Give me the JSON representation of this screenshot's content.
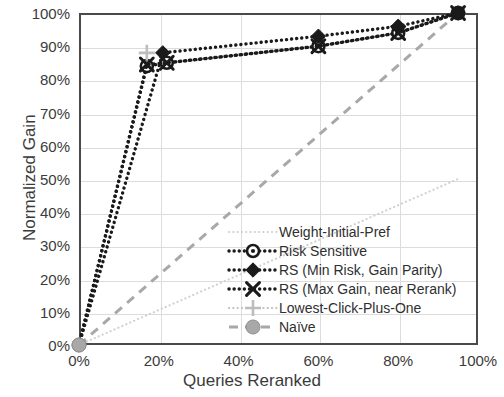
{
  "chart_data": {
    "type": "line",
    "title": "",
    "xlabel": "Queries Reranked",
    "ylabel": "Normalized Gain",
    "xlim": [
      0,
      100
    ],
    "ylim": [
      0,
      100
    ],
    "xticks": [
      "0%",
      "20%",
      "40%",
      "60%",
      "80%",
      "100%"
    ],
    "yticks": [
      "0%",
      "10%",
      "20%",
      "30%",
      "40%",
      "50%",
      "60%",
      "70%",
      "80%",
      "90%",
      "100%"
    ],
    "grid": true,
    "legend_position": "inside lower-right",
    "series": [
      {
        "name": "Weight-Initial-Pref",
        "marker": "none",
        "line": "dotted-light",
        "color": "#d0d0d0",
        "points": [
          [
            0,
            0
          ],
          [
            95,
            50
          ]
        ]
      },
      {
        "name": "Risk Sensitive",
        "marker": "circle-dot",
        "line": "dotted",
        "color": "#1a1a1a",
        "points": [
          [
            0,
            0
          ],
          [
            17,
            84
          ],
          [
            22,
            85
          ],
          [
            60,
            90
          ],
          [
            80,
            94
          ],
          [
            95,
            100
          ]
        ]
      },
      {
        "name": "RS (Min Risk, Gain Parity)",
        "marker": "diamond",
        "line": "dotted",
        "color": "#1a1a1a",
        "points": [
          [
            0,
            0
          ],
          [
            21,
            88
          ],
          [
            60,
            93
          ],
          [
            80,
            96
          ],
          [
            95,
            100
          ]
        ]
      },
      {
        "name": "RS (Max Gain, near Rerank)",
        "marker": "x",
        "line": "dotted",
        "color": "#1a1a1a",
        "points": [
          [
            0,
            0
          ],
          [
            17,
            84.5
          ],
          [
            22,
            85
          ],
          [
            60,
            90
          ],
          [
            80,
            94
          ],
          [
            95,
            100
          ]
        ]
      },
      {
        "name": "Lowest-Click-Plus-One",
        "marker": "plus",
        "line": "dotted-light",
        "color": "#bdbdbd",
        "points": [
          [
            17,
            88
          ]
        ]
      },
      {
        "name": "Naïve",
        "marker": "circle-filled",
        "line": "dashed",
        "color": "#a8a8a8",
        "points": [
          [
            0,
            0
          ],
          [
            95,
            100
          ]
        ]
      }
    ]
  },
  "legend": {
    "items": [
      {
        "label": "Weight-Initial-Pref"
      },
      {
        "label": "Risk Sensitive"
      },
      {
        "label": "RS (Min Risk, Gain Parity)"
      },
      {
        "label": "RS (Max Gain, near Rerank)"
      },
      {
        "label": "Lowest-Click-Plus-One"
      },
      {
        "label": "Naïve"
      }
    ]
  },
  "axes": {
    "x_title": "Queries Reranked",
    "y_title": "Normalized Gain",
    "x_labels": [
      "0%",
      "20%",
      "40%",
      "60%",
      "80%",
      "100%"
    ],
    "y_labels": [
      "100%",
      "90%",
      "80%",
      "70%",
      "60%",
      "50%",
      "40%",
      "30%",
      "20%",
      "10%",
      "0%"
    ]
  },
  "colors": {
    "series_dark": "#1a1a1a",
    "series_gray": "#a8a8a8",
    "series_light": "#d0d0d0",
    "grid": "#dcdcdc",
    "frame": "#4a4a4a",
    "text": "#3b3b3b"
  }
}
